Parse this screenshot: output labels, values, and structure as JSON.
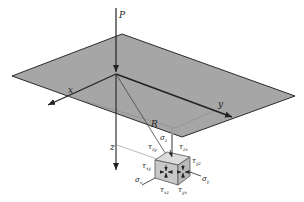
{
  "figure": {
    "colors": {
      "plane_fill": "#a6a6a6",
      "plane_edge": "#2a2a2a",
      "cube_fill": "#cfcfcf",
      "line": "#222222",
      "guide": "#8a8a8a",
      "background": "#ffffff"
    },
    "labels": {
      "load": "P",
      "axis_x": "x",
      "axis_y": "y",
      "axis_z": "z",
      "radius": "R"
    },
    "stresses": {
      "sigma_z": {
        "sym": "σ",
        "sub": "z"
      },
      "sigma_x": {
        "sym": "σ",
        "sub": "x"
      },
      "sigma_y": {
        "sym": "σ",
        "sub": "y"
      },
      "tau_zy": {
        "sym": "τ",
        "sub": "zy"
      },
      "tau_zx_top": {
        "sym": "τ",
        "sub": "zx"
      },
      "tau_xy": {
        "sym": "τ",
        "sub": "xy"
      },
      "tau_yz": {
        "sym": "τ",
        "sub": "yz"
      },
      "tau_xz": {
        "sym": "τ",
        "sub": "xz"
      },
      "tau_yx": {
        "sym": "τ",
        "sub": "yx"
      }
    }
  }
}
